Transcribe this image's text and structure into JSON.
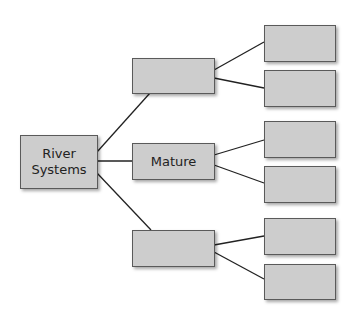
{
  "diagram": {
    "root": {
      "label": "River Systems",
      "line1": "River",
      "line2": "Systems"
    },
    "branches": [
      {
        "label": "",
        "children": [
          "",
          ""
        ]
      },
      {
        "label": "Mature",
        "children": [
          "",
          ""
        ]
      },
      {
        "label": "",
        "children": [
          "",
          ""
        ]
      }
    ]
  },
  "colors": {
    "box_fill": "#cdcdcd",
    "box_border": "#5a5a5a",
    "line": "#222222"
  }
}
